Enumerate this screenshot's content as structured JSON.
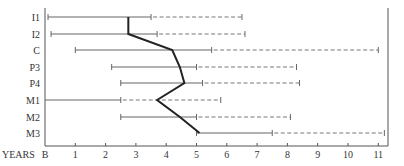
{
  "chart_data": {
    "type": "range-bar",
    "title": "",
    "xlabel": "YEARS",
    "ylabel": "",
    "x_tick_labels": [
      "B",
      "1",
      "2",
      "3",
      "4",
      "5",
      "6",
      "7",
      "8",
      "9",
      "10",
      "11"
    ],
    "xlim": [
      0,
      11.5
    ],
    "grid": false,
    "legend": null,
    "categories": [
      "I1",
      "I2",
      "C",
      "P3",
      "P4",
      "M1",
      "M2",
      "M3"
    ],
    "series": [
      {
        "name": "solid_range_start",
        "values": [
          0.1,
          0.2,
          1.0,
          2.2,
          2.5,
          0.0,
          2.5,
          5.0
        ]
      },
      {
        "name": "solid_range_end",
        "values": [
          3.5,
          3.7,
          5.5,
          5.0,
          5.2,
          2.5,
          5.0,
          7.5
        ]
      },
      {
        "name": "dashed_range_end",
        "values": [
          6.5,
          6.6,
          11.0,
          8.3,
          8.4,
          5.8,
          8.1,
          11.2
        ]
      },
      {
        "name": "median_line",
        "values": [
          2.75,
          2.75,
          4.2,
          4.45,
          4.6,
          3.7,
          4.45,
          5.1
        ]
      }
    ]
  }
}
